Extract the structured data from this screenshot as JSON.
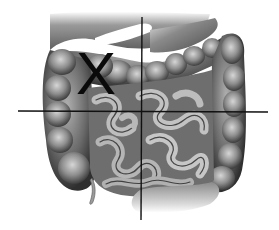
{
  "figure": {
    "style": "grayscale anatomical drawing",
    "colors": {
      "background": "#ffffff",
      "line": "#111111",
      "tissue_dark": "#3c3c3c",
      "tissue_mid": "#7a7a7a",
      "tissue_light": "#b8b8b8",
      "highlight": "#e6e6e6"
    }
  },
  "quadrant_lines": {
    "vertical": {
      "x1": 142,
      "y1": 17,
      "x2": 141,
      "y2": 220
    },
    "horizontal": {
      "x1": 18,
      "y1": 111,
      "x2": 268,
      "y2": 112
    }
  },
  "marker": {
    "label": "X",
    "quadrant": "upper-left",
    "color": "#0a0a0a"
  }
}
